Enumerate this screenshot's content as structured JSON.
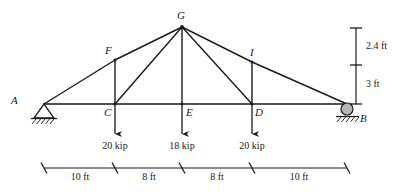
{
  "diagram": {
    "type": "structural-truss",
    "line_color": "#1a1a1a",
    "roller_fill": "#b5b5b5",
    "background": "#ffffff"
  },
  "joints": {
    "A": {
      "label": "A",
      "x": 44,
      "y": 104,
      "support": "pin"
    },
    "B": {
      "label": "B",
      "x": 347,
      "y": 104,
      "support": "roller"
    },
    "C": {
      "label": "C",
      "x": 115,
      "y": 104,
      "support": "none"
    },
    "D": {
      "label": "D",
      "x": 252,
      "y": 104,
      "support": "none"
    },
    "E": {
      "label": "E",
      "x": 182,
      "y": 104,
      "support": "none"
    },
    "F": {
      "label": "F",
      "x": 115,
      "y": 60,
      "support": "none"
    },
    "G": {
      "label": "G",
      "x": 182,
      "y": 27,
      "support": "none"
    },
    "I": {
      "label": "I",
      "x": 252,
      "y": 62,
      "support": "none"
    }
  },
  "loads": [
    {
      "at": "C",
      "label": "20 kip",
      "value": 20,
      "unit": "kip",
      "direction": "down"
    },
    {
      "at": "E",
      "label": "18 kip",
      "value": 18,
      "unit": "kip",
      "direction": "down"
    },
    {
      "at": "D",
      "label": "20 kip",
      "value": 20,
      "unit": "kip",
      "direction": "down"
    }
  ],
  "horizontal_dimensions": [
    {
      "label": "10 ft",
      "value": 10,
      "unit": "ft",
      "from": "A",
      "to": "C"
    },
    {
      "label": "8 ft",
      "value": 8,
      "unit": "ft",
      "from": "C",
      "to": "E"
    },
    {
      "label": "8 ft",
      "value": 8,
      "unit": "ft",
      "from": "E",
      "to": "D"
    },
    {
      "label": "10 ft",
      "value": 10,
      "unit": "ft",
      "from": "D",
      "to": "B"
    }
  ],
  "vertical_dimensions": [
    {
      "label": "2.4 ft",
      "value": 2.4,
      "unit": "ft",
      "span": "apex-to-intermediate"
    },
    {
      "label": "3 ft",
      "value": 3,
      "unit": "ft",
      "span": "intermediate-to-chord"
    }
  ]
}
